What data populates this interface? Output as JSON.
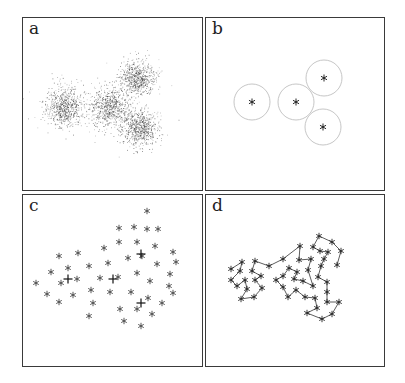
{
  "figure": {
    "panels": [
      {
        "id": "a",
        "label": "a",
        "description": "Scatter cloud of many sample points forming four Gaussian clusters"
      },
      {
        "id": "b",
        "label": "b",
        "description": "Four cluster centroids (stars) with circles indicating cluster spread"
      },
      {
        "id": "c",
        "label": "c",
        "description": "Sampled prototype points (asterisks) with four cross markers at centroids"
      },
      {
        "id": "d",
        "label": "d",
        "description": "Prototype points connected as a chain/path"
      }
    ]
  },
  "chart_data": [
    {
      "panel": "a",
      "type": "scatter",
      "title": "",
      "clusters": [
        {
          "center": [
            63,
            107
          ],
          "spread": 10,
          "n": 700
        },
        {
          "center": [
            110,
            107
          ],
          "spread": 10,
          "n": 700
        },
        {
          "center": [
            137,
            78
          ],
          "spread": 9,
          "n": 650
        },
        {
          "center": [
            140,
            128
          ],
          "spread": 9,
          "n": 650
        }
      ],
      "point_color": "#2a2a2a",
      "units": "pixel coordinates (page)"
    },
    {
      "panel": "b",
      "type": "scatter",
      "centroids": [
        [
          252,
          102
        ],
        [
          296,
          102
        ],
        [
          324,
          78
        ],
        [
          323,
          127
        ]
      ],
      "circle_radius": 18,
      "circle_color": "#b8b8b8",
      "marker": "*",
      "units": "pixel coordinates (page)"
    },
    {
      "panel": "c",
      "type": "scatter",
      "marker": "*",
      "points": [
        [
          147,
          211
        ],
        [
          119,
          228
        ],
        [
          134,
          227
        ],
        [
          147,
          229
        ],
        [
          158,
          229
        ],
        [
          119,
          242
        ],
        [
          137,
          242
        ],
        [
          155,
          246
        ],
        [
          104,
          248
        ],
        [
          173,
          252
        ],
        [
          59,
          256
        ],
        [
          78,
          253
        ],
        [
          128,
          258
        ],
        [
          142,
          256
        ],
        [
          176,
          262
        ],
        [
          89,
          266
        ],
        [
          108,
          263
        ],
        [
          157,
          264
        ],
        [
          68,
          268
        ],
        [
          51,
          272
        ],
        [
          137,
          273
        ],
        [
          170,
          274
        ],
        [
          36,
          283
        ],
        [
          61,
          283
        ],
        [
          77,
          279
        ],
        [
          100,
          278
        ],
        [
          118,
          277
        ],
        [
          150,
          281
        ],
        [
          91,
          290
        ],
        [
          169,
          286
        ],
        [
          47,
          294
        ],
        [
          73,
          295
        ],
        [
          110,
          292
        ],
        [
          131,
          292
        ],
        [
          173,
          293
        ],
        [
          148,
          298
        ],
        [
          59,
          302
        ],
        [
          93,
          303
        ],
        [
          162,
          303
        ],
        [
          120,
          309
        ],
        [
          137,
          309
        ],
        [
          152,
          314
        ],
        [
          89,
          316
        ],
        [
          124,
          321
        ],
        [
          141,
          326
        ]
      ],
      "crosses": [
        [
          68,
          279
        ],
        [
          113,
          279
        ],
        [
          141,
          254
        ],
        [
          141,
          303
        ]
      ],
      "units": "pixel coordinates (page)"
    },
    {
      "panel": "d",
      "type": "line",
      "marker": "*",
      "path": [
        [
          231,
          269
        ],
        [
          242,
          262
        ],
        [
          240,
          271
        ],
        [
          231,
          280
        ],
        [
          237,
          286
        ],
        [
          245,
          280
        ],
        [
          247,
          289
        ],
        [
          241,
          299
        ],
        [
          254,
          297
        ],
        [
          262,
          288
        ],
        [
          255,
          280
        ],
        [
          261,
          276
        ],
        [
          252,
          271
        ],
        [
          255,
          261
        ],
        [
          269,
          266
        ],
        [
          283,
          259
        ],
        [
          300,
          246
        ],
        [
          299,
          260
        ],
        [
          311,
          259
        ],
        [
          308,
          270
        ],
        [
          313,
          286
        ],
        [
          303,
          281
        ],
        [
          294,
          279
        ],
        [
          297,
          272
        ],
        [
          289,
          268
        ],
        [
          283,
          276
        ],
        [
          276,
          280
        ],
        [
          283,
          287
        ],
        [
          288,
          297
        ],
        [
          296,
          290
        ],
        [
          305,
          297
        ],
        [
          315,
          298
        ],
        [
          317,
          308
        ],
        [
          307,
          313
        ],
        [
          322,
          319
        ],
        [
          332,
          314
        ],
        [
          339,
          302
        ],
        [
          327,
          302
        ],
        [
          327,
          292
        ],
        [
          327,
          282
        ],
        [
          318,
          277
        ],
        [
          321,
          266
        ],
        [
          324,
          259
        ],
        [
          328,
          252
        ],
        [
          320,
          251
        ],
        [
          313,
          247
        ],
        [
          319,
          236
        ],
        [
          332,
          242
        ],
        [
          341,
          251
        ],
        [
          337,
          265
        ]
      ],
      "units": "pixel coordinates (page)"
    }
  ]
}
